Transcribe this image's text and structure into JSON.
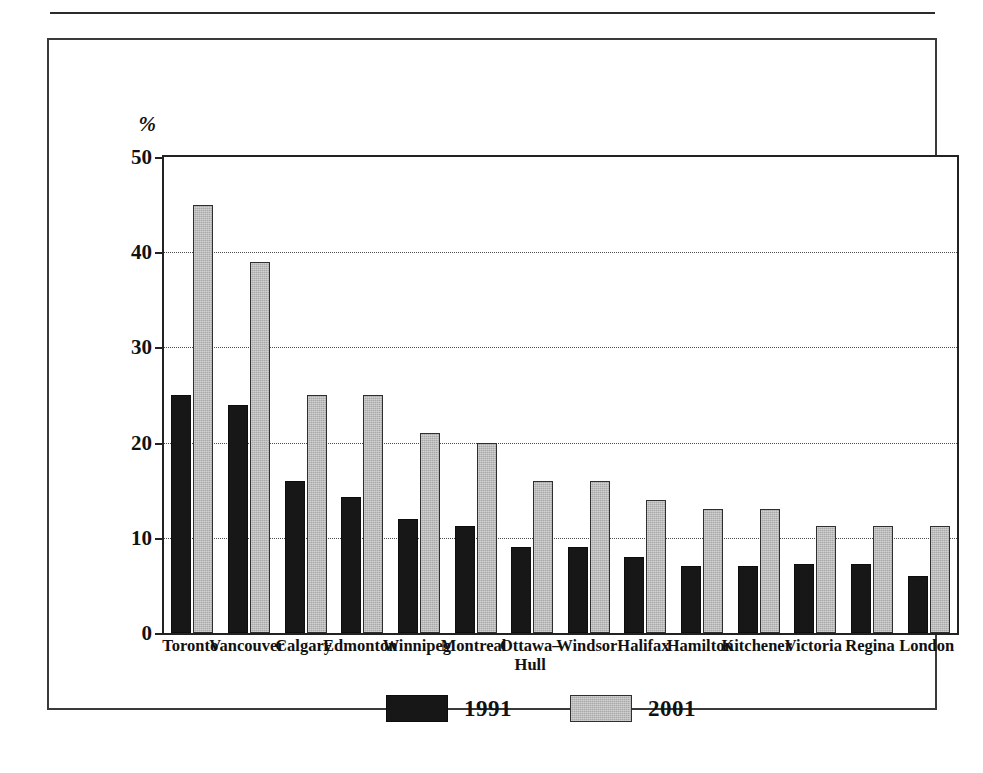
{
  "chart_data": {
    "type": "bar",
    "title": "",
    "xlabel": "",
    "ylabel": "%",
    "ylim": [
      0,
      50
    ],
    "yticks": [
      0,
      10,
      20,
      30,
      40,
      50
    ],
    "grid": true,
    "legend_position": "bottom-center",
    "categories": [
      "Toronto",
      "Vancouver",
      "Calgary",
      "Edmonton",
      "Winnipeg",
      "Montreal",
      "Ottawa– Hull",
      "Windsor",
      "Halifax",
      "Hamilton",
      "Kitchener",
      "Victoria",
      "Regina",
      "London"
    ],
    "category_lines": [
      [
        "Toronto"
      ],
      [
        "Vancouver"
      ],
      [
        "Calgary"
      ],
      [
        "Edmonton"
      ],
      [
        "Winnipeg"
      ],
      [
        "Montreal"
      ],
      [
        "Ottawa–",
        "Hull"
      ],
      [
        "Windsor"
      ],
      [
        "Halifax"
      ],
      [
        "Hamilton"
      ],
      [
        "Kitchener"
      ],
      [
        "Victoria"
      ],
      [
        "Regina"
      ],
      [
        "London"
      ]
    ],
    "series": [
      {
        "name": "1991",
        "color": "#171717",
        "values": [
          25,
          24,
          16,
          14.3,
          12,
          11.2,
          9,
          9,
          8,
          7,
          7,
          7.2,
          7.2,
          6
        ]
      },
      {
        "name": "2001",
        "color": "#a9a9a9",
        "values": [
          45,
          39,
          25,
          25,
          21,
          20,
          16,
          16,
          14,
          13,
          13,
          11.2,
          11.2,
          11.2
        ]
      }
    ]
  },
  "legend": {
    "items": [
      {
        "label": "1991",
        "swatch": "s1991"
      },
      {
        "label": "2001",
        "swatch": "s2001"
      }
    ]
  },
  "axis": {
    "unit_symbol": "%"
  }
}
